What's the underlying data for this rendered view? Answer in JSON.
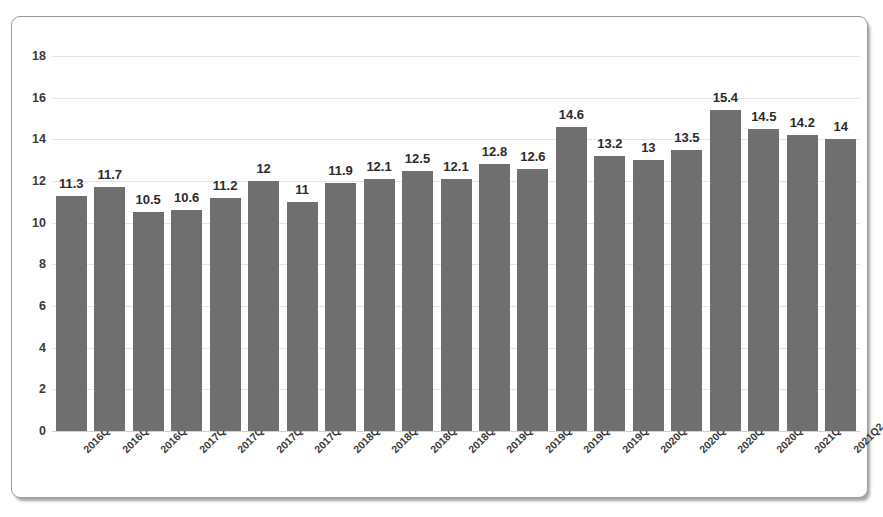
{
  "chart_data": {
    "type": "bar",
    "title": "",
    "subtitle": "",
    "xlabel": "",
    "ylabel": "",
    "ylim": [
      0,
      18
    ],
    "yticks": [
      0,
      2,
      4,
      6,
      8,
      10,
      12,
      14,
      16,
      18
    ],
    "ytick_labels": [
      "0",
      "2",
      "4",
      "6",
      "8",
      "10",
      "12",
      "14",
      "16",
      "18"
    ],
    "grid": true,
    "grid_axis": "y",
    "legend": false,
    "legend_position": "none",
    "bar_color": "#6f6f6f",
    "data_label_color": "#2b2b2b",
    "gridline_color": "#e3e3e6",
    "frame_border_color": "#9a9a9a",
    "background_color": "#ffffff",
    "categories": [
      "2016Q2",
      "2016Q3",
      "2016Q4",
      "2017Q1",
      "2017Q2",
      "2017Q3",
      "2017Q4",
      "2018Q1",
      "2018Q2",
      "2018Q3",
      "2018Q4",
      "2019Q1",
      "2019Q2",
      "2019Q3",
      "2019Q4",
      "2020Q1",
      "2020Q2",
      "2020Q3",
      "2020Q4",
      "2021Q1",
      "2021Q2"
    ],
    "values": [
      11.3,
      11.7,
      10.5,
      10.6,
      11.2,
      12,
      11,
      11.9,
      12.1,
      12.5,
      12.1,
      12.8,
      12.6,
      14.6,
      13.2,
      13,
      13.5,
      15.4,
      14.5,
      14.2,
      14
    ],
    "data_labels": [
      "11.3",
      "11.7",
      "10.5",
      "10.6",
      "11.2",
      "12",
      "11",
      "11.9",
      "12.1",
      "12.5",
      "12.1",
      "12.8",
      "12.6",
      "14.6",
      "13.2",
      "13",
      "13.5",
      "15.4",
      "14.5",
      "14.2",
      "14"
    ]
  }
}
